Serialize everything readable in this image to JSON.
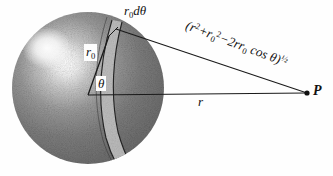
{
  "figure": {
    "name": "sphere-geometry-diagram",
    "background_color": "#fefefe",
    "ink_color": "#111111"
  },
  "sphere": {
    "name": "shaded-sphere",
    "center_x": 88,
    "center_y": 88,
    "radius": 76,
    "fill_dark": "#6d6d6d",
    "fill_mid": "#8a8a8a",
    "highlight_color": "#f2f2f2",
    "highlight_x": 47,
    "highlight_y": 48,
    "texture": "stippled-grain"
  },
  "band": {
    "name": "annular-band-element",
    "label": "r₀dθ",
    "fill_color": "#b9b9b9",
    "edge_color": "#2a2a2a"
  },
  "labels": {
    "r0_dtheta": {
      "base": "r",
      "sub": "0",
      "tail": "dθ"
    },
    "r0": {
      "base": "r",
      "sub": "0"
    },
    "theta": "θ",
    "r": "r",
    "point_p": "P",
    "distance": {
      "open": "(",
      "r_sq_base": "r",
      "r_sq_sup": "2",
      "plus": "+",
      "r0_base": "r",
      "r0_sub": "0",
      "r0_sup": "2",
      "minus": "−",
      "two_r_r0": "2rr",
      "two_r_r0_sub": "0",
      "cos": "cos",
      "theta": "θ",
      "close": ")",
      "exponent": "½"
    }
  },
  "lines": {
    "radius_r0": {
      "name": "radius-line-r0",
      "from_x": 88,
      "from_y": 95,
      "to_x": 109,
      "to_y": 36
    },
    "radius_r": {
      "name": "radius-line-r",
      "from_x": 88,
      "from_y": 95,
      "to_x": 307,
      "to_y": 93
    },
    "slant": {
      "name": "slant-distance-line",
      "from_x": 116,
      "from_y": 29,
      "to_x": 307,
      "to_y": 93
    }
  },
  "point_marker": {
    "name": "point-p-marker",
    "x": 307,
    "y": 93,
    "radius": 2.6
  }
}
